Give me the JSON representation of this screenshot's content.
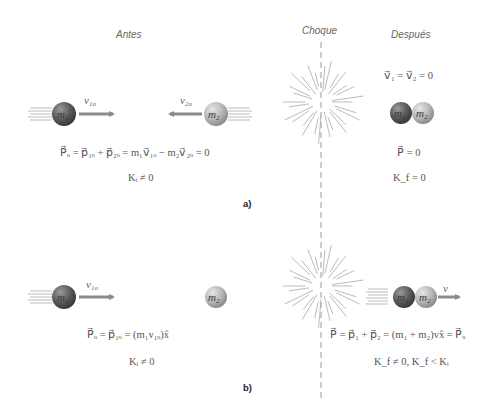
{
  "part_a": {
    "heading_before": "Antes",
    "heading_collision": "Choque",
    "heading_after": "Después",
    "ball1_label": "m",
    "ball1_sub": "1",
    "ball2_label": "m",
    "ball2_sub": "2",
    "velocity1_label": "v",
    "velocity1_sub": "1o",
    "velocity2_label": "v",
    "velocity2_sub": "2o",
    "eq_momentum_before": "P⃗ₒ = p⃗₁ₒ + p⃗₂ₒ = m₁v⃗₁ₒ − m₂v⃗₂ₒ = 0",
    "eq_kinetic_before": "Kᵢ ≠ 0",
    "eq_velocity_after": "v⃗₁ = v⃗₂ = 0",
    "eq_momentum_after": "P⃗ = 0",
    "eq_kinetic_after": "K_f = 0",
    "label": "a)"
  },
  "part_b": {
    "ball1_label": "m",
    "ball1_sub": "1",
    "ball2_label": "m",
    "ball2_sub": "2",
    "velocity1_label": "v",
    "velocity1_sub": "1o",
    "velocity_after_label": "v",
    "eq_momentum_before": "P⃗ₒ = p⃗₁ₒ = (m₁v₁ₒ)x̂",
    "eq_kinetic_before": "Kᵢ ≠ 0",
    "eq_momentum_after": "P⃗ = p⃗₁ + p⃗₂ = (m₁ + m₂)vx̂ = P⃗ₒ",
    "eq_kinetic_after": "K_f ≠ 0, K_f < Kᵢ",
    "label": "b)"
  },
  "colors": {
    "ball_dark": "#5a5a5a",
    "ball_light": "#b8b8b8",
    "arrow": "#8a8a8a",
    "lines": "#aaaaaa"
  }
}
